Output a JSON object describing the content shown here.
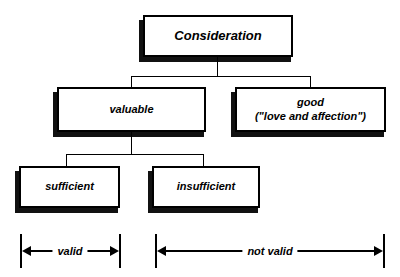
{
  "diagram": {
    "colors": {
      "stroke": "#000000",
      "fill": "#ffffff",
      "shadow": "#111111"
    },
    "nodes": {
      "root": {
        "label": "Consideration"
      },
      "valuable": {
        "label": "valuable"
      },
      "good": {
        "label_line1": "good",
        "label_line2": "(\"love and affection\")"
      },
      "sufficient": {
        "label": "sufficient"
      },
      "insufficient": {
        "label": "insufficient"
      }
    },
    "ranges": {
      "valid": {
        "label": "valid"
      },
      "not_valid": {
        "label": "not valid"
      }
    }
  }
}
